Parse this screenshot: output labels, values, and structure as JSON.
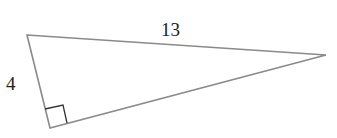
{
  "diagram": {
    "type": "right-triangle",
    "vertices": {
      "top_left": [
        27,
        35
      ],
      "right": [
        326,
        55
      ],
      "bottom": [
        50,
        128
      ]
    },
    "right_angle_at": "bottom",
    "labels": {
      "hypotenuse": "13",
      "left_leg": "4"
    },
    "colors": {
      "stroke": "#8a8a8a",
      "right_angle_marker": "#333333",
      "text": "#222222"
    }
  }
}
